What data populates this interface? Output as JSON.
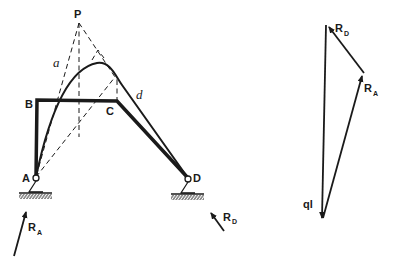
{
  "figure": {
    "frame": {
      "points": {
        "A": {
          "label": "A",
          "x": 36,
          "y": 177
        },
        "B": {
          "label": "B",
          "x": 37,
          "y": 100
        },
        "C": {
          "label": "C",
          "x": 117,
          "y": 101
        },
        "D": {
          "label": "D",
          "x": 188,
          "y": 178
        },
        "P": {
          "label": "P",
          "x": 79,
          "y": 23
        }
      },
      "curve_labels": {
        "a": "a",
        "d": "d"
      }
    },
    "reactions": {
      "RA": {
        "R": "R",
        "sub": "A"
      },
      "RD": {
        "R": "R",
        "sub": "D"
      }
    },
    "force_polygon": {
      "load_label": "ql",
      "RA": {
        "R": "R",
        "sub": "A"
      },
      "RD": {
        "R": "R",
        "sub": "D"
      }
    },
    "colors": {
      "ink": "#1a1a1a",
      "background": "#ffffff"
    }
  }
}
